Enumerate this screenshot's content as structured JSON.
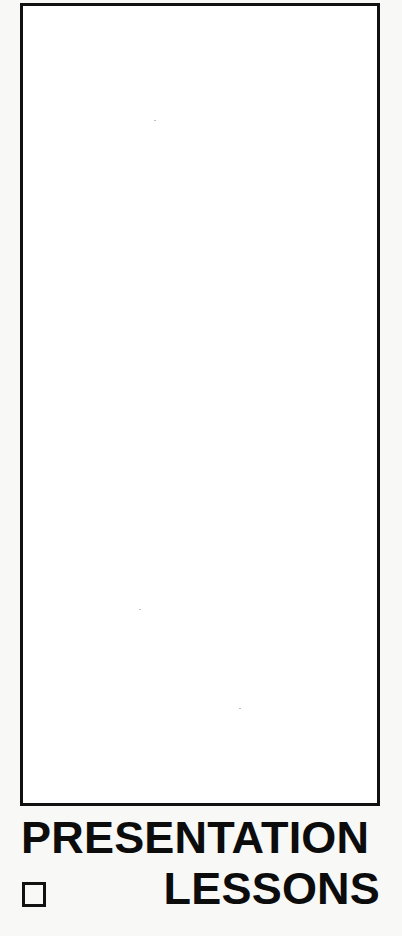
{
  "page": {
    "background_color": "#f8f8f7",
    "frame": {
      "border_color": "#111111",
      "fill_color": "#ffffff",
      "content": ""
    },
    "title": {
      "line1": "PRESENTATION",
      "line2": "LESSONS",
      "color": "#0c0c0c"
    },
    "checkbox": {
      "icon": "empty-square-checkbox",
      "checked": false
    }
  }
}
